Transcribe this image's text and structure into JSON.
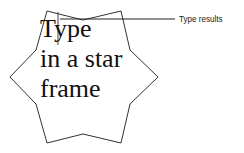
{
  "frame": {
    "shape": "star",
    "points": "47,11 83,20 121,11 130,50 158,77 130,104 121,143 83,134 47,143 36,104 10,77 36,50",
    "stroke_color": "#333333",
    "lines": [
      "Type",
      "in a star",
      "frame"
    ]
  },
  "callout": {
    "label": "Type results",
    "line_color": "#222222"
  },
  "cursor": {
    "color": "#333333"
  }
}
